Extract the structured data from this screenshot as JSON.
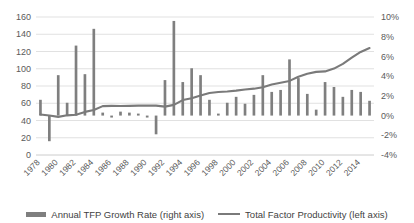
{
  "chart_data": {
    "type": "bar",
    "title": "",
    "xlabel": "",
    "ylabel": "",
    "grid": true,
    "legend_position": "bottom",
    "x": [
      1978,
      1979,
      1980,
      1981,
      1982,
      1983,
      1984,
      1985,
      1986,
      1987,
      1988,
      1989,
      1990,
      1991,
      1992,
      1993,
      1994,
      1995,
      1996,
      1997,
      1998,
      1999,
      2000,
      2001,
      2002,
      2003,
      2004,
      2005,
      2006,
      2007,
      2008,
      2009,
      2010,
      2011,
      2012,
      2013,
      2014,
      2015
    ],
    "xtick_labels": [
      "1978",
      "1980",
      "1982",
      "1984",
      "1986",
      "1988",
      "1990",
      "1992",
      "1994",
      "1996",
      "1998",
      "2000",
      "2002",
      "2004",
      "2006",
      "2008",
      "2010",
      "2012",
      "2014"
    ],
    "left_axis": {
      "name": "Total Factor Productivity (left axis)",
      "ticks": [
        0,
        20,
        40,
        60,
        80,
        100,
        120,
        140,
        160
      ],
      "tick_labels": [
        "0",
        "20",
        "40",
        "60",
        "80",
        "100",
        "120",
        "140",
        "160"
      ],
      "ylim": [
        0,
        160
      ]
    },
    "right_axis": {
      "name": "Annual TFP Growth Rate (right axis)",
      "ticks": [
        -4,
        -2,
        0,
        2,
        4,
        6,
        8,
        10
      ],
      "tick_labels": [
        "-4%",
        "-2%",
        "0%",
        "2%",
        "4%",
        "6%",
        "8%",
        "10%"
      ],
      "ylim": [
        -4,
        10
      ]
    },
    "series": [
      {
        "name": "Annual TFP Growth Rate (right axis)",
        "type": "bar",
        "axis": "right",
        "unit": "%",
        "color": "#7f7f7f",
        "values": [
          1.6,
          -2.6,
          4.1,
          1.3,
          7.1,
          4.2,
          8.8,
          0.3,
          -0.2,
          0.4,
          0.3,
          0.2,
          -0.2,
          -1.9,
          3.6,
          9.6,
          3.4,
          4.8,
          4.1,
          1.6,
          0.2,
          1.3,
          1.9,
          1.2,
          2.1,
          4.1,
          2.4,
          2.6,
          5.7,
          3.8,
          2.2,
          0.6,
          3.4,
          2.9,
          1.9,
          2.6,
          2.4,
          1.5
        ]
      },
      {
        "name": "Total Factor Productivity (left axis)",
        "type": "line",
        "axis": "left",
        "unit": "index",
        "color": "#7a7a7a",
        "values": [
          47,
          45.8,
          44.2,
          46.0,
          46.6,
          50.0,
          52.1,
          56.7,
          56.9,
          56.8,
          57.0,
          57.2,
          57.3,
          57.2,
          56.1,
          58.1,
          63.7,
          65.9,
          69.0,
          71.9,
          73.0,
          73.6,
          74.6,
          76.0,
          76.9,
          78.5,
          81.7,
          83.7,
          85.9,
          90.8,
          94.3,
          96.4,
          96.9,
          100.2,
          105.6,
          112.8,
          119.5,
          124.0
        ]
      }
    ]
  },
  "legend": {
    "bar_label": "Annual TFP Growth Rate (right axis)",
    "line_label": "Total Factor Productivity (left axis)"
  }
}
